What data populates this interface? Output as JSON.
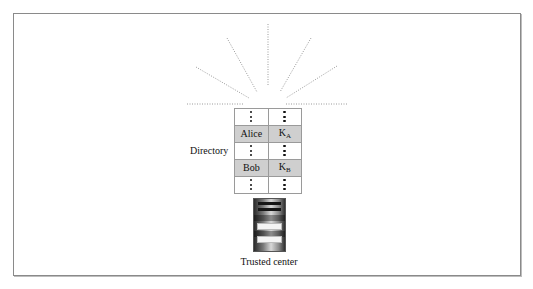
{
  "diagram": {
    "type": "directory-broadcast",
    "directory": {
      "label": "Directory",
      "rows": [
        {
          "name": "⋮",
          "key": "⋮",
          "key_sub": "",
          "highlight": false
        },
        {
          "name": "Alice",
          "key": "K",
          "key_sub": "A",
          "highlight": true
        },
        {
          "name": "⋮",
          "key": "⋮",
          "key_sub": "",
          "highlight": false
        },
        {
          "name": "Bob",
          "key": "K",
          "key_sub": "B",
          "highlight": true
        },
        {
          "name": "⋮",
          "key": "⋮",
          "key_sub": "",
          "highlight": false
        }
      ]
    },
    "server": {
      "label": "Trusted center",
      "icon": "server-tower-icon"
    },
    "broadcast_rays": {
      "count": 7,
      "style": "dotted",
      "color": "#9a9a9a"
    },
    "colors": {
      "row_highlight": "#cfcfcf",
      "frame_border": "#8a8a8a",
      "background": "#ffffff"
    }
  }
}
